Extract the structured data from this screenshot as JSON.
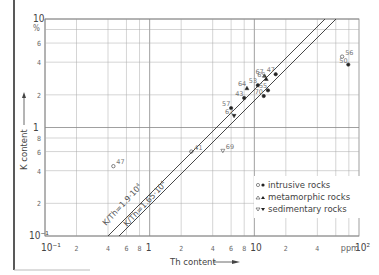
{
  "chart_data": {
    "type": "scatter",
    "title": "",
    "xlabel": "Th content",
    "ylabel": "K content",
    "x_unit": "ppm",
    "y_unit": "%",
    "x_scale": "log",
    "y_scale": "log",
    "xlim": [
      0.1,
      100
    ],
    "ylim": [
      0.1,
      10
    ],
    "grid": true,
    "x_tick_labels": [
      "10-1",
      "2",
      "4",
      "6",
      "8",
      "1",
      "2",
      "4",
      "6",
      "8",
      "10",
      "2",
      "4",
      "ppm",
      "10 2"
    ],
    "y_tick_labels": [
      "10",
      "%",
      "6",
      "4",
      "2",
      "1",
      "8",
      "6",
      "4",
      "2",
      "10-1"
    ],
    "reference_lines": [
      {
        "label": "K/Th=1.9·10^4",
        "ratio": 1.9
      },
      {
        "label": "K/Th=1.65·10^4",
        "ratio": 1.65
      }
    ],
    "legend": {
      "position": "lower right",
      "entries": [
        {
          "label": "intrusive rocks",
          "markers": [
            "open circle",
            "filled circle"
          ]
        },
        {
          "label": "metamorphic rocks",
          "markers": [
            "open triangle",
            "filled triangle"
          ]
        },
        {
          "label": "sedimentary rocks",
          "markers": [
            "open inverted triangle",
            "filled inverted triangle"
          ]
        }
      ]
    },
    "points": [
      {
        "id": "56",
        "x": 69,
        "y": 4.5,
        "type": "intrusive",
        "filled": false
      },
      {
        "id": "50",
        "x": 79,
        "y": 3.8,
        "type": "intrusive",
        "filled": true
      },
      {
        "id": "47",
        "x": 16,
        "y": 3.1,
        "type": "intrusive",
        "filled": true
      },
      {
        "id": "67",
        "x": 12.5,
        "y": 3.0,
        "type": "metamorphic",
        "filled": true
      },
      {
        "id": "65",
        "x": 13,
        "y": 2.8,
        "type": "metamorphic",
        "filled": true
      },
      {
        "id": "64",
        "x": 8.5,
        "y": 2.3,
        "type": "metamorphic",
        "filled": true
      },
      {
        "id": "53",
        "x": 10.8,
        "y": 2.45,
        "type": "intrusive",
        "filled": true
      },
      {
        "id": "55",
        "x": 13.5,
        "y": 2.2,
        "type": "intrusive",
        "filled": true
      },
      {
        "id": "70",
        "x": 12.3,
        "y": 1.95,
        "type": "intrusive",
        "filled": true
      },
      {
        "id": "43",
        "x": 8.0,
        "y": 1.87,
        "type": "intrusive",
        "filled": true
      },
      {
        "id": "57",
        "x": 6.0,
        "y": 1.51,
        "type": "intrusive",
        "filled": true
      },
      {
        "id": "62",
        "x": 6.4,
        "y": 1.28,
        "type": "sedimentary",
        "filled": true
      },
      {
        "id": "69",
        "x": 5.0,
        "y": 0.61,
        "type": "sedimentary",
        "filled": false
      },
      {
        "id": "41",
        "x": 2.5,
        "y": 0.6,
        "type": "intrusive",
        "filled": false
      },
      {
        "id": "47b",
        "label": "47",
        "x": 0.45,
        "y": 0.44,
        "type": "intrusive",
        "filled": false
      }
    ]
  },
  "labels": {
    "y_axis": "K content",
    "x_axis": "Th content",
    "line_upper": "K/Th=1.9·10",
    "line_upper_exp": "4",
    "line_lower": "K/Th=1.65·10",
    "line_lower_exp": "4",
    "legend_1": "intrusive rocks",
    "legend_2": "metamorphic rocks",
    "legend_3": "sedimentary rocks",
    "x_unit": "ppm",
    "y_unit": "%"
  }
}
